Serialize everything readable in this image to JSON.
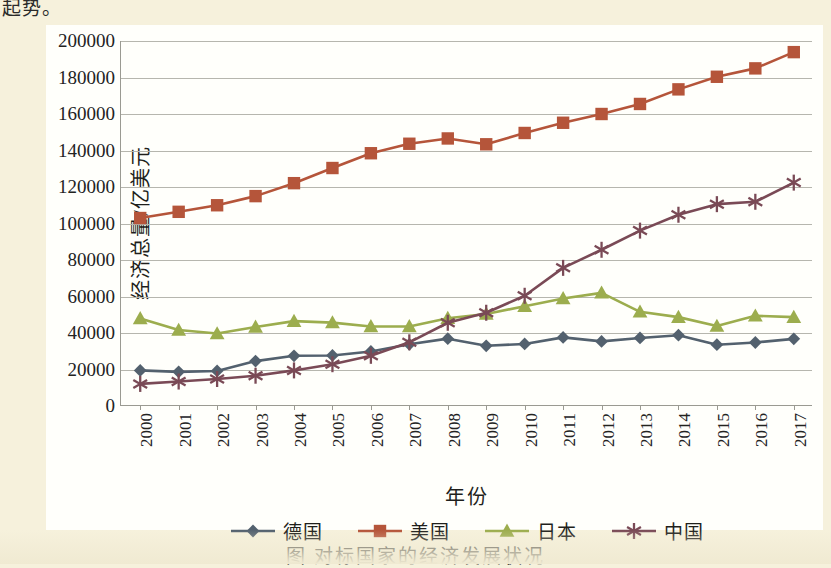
{
  "page": {
    "top_partial_text": "起势。",
    "caption": "图  对标国家的经济发展状况",
    "background_color": "#f6f1dc",
    "panel_color": "#fffffb"
  },
  "chart_data": {
    "type": "line",
    "title": "",
    "xlabel": "年份",
    "ylabel": "经济总量/亿美元",
    "grid": true,
    "legend_position": "bottom",
    "categories": [
      "2000",
      "2001",
      "2002",
      "2003",
      "2004",
      "2005",
      "2006",
      "2007",
      "2008",
      "2009",
      "2010",
      "2011",
      "2012",
      "2013",
      "2014",
      "2015",
      "2016",
      "2017"
    ],
    "x": [
      2000,
      2001,
      2002,
      2003,
      2004,
      2005,
      2006,
      2007,
      2008,
      2009,
      2010,
      2011,
      2012,
      2013,
      2014,
      2015,
      2016,
      2017
    ],
    "ylim": [
      0,
      200000
    ],
    "ytick_step": 20000,
    "yticks": [
      0,
      20000,
      40000,
      60000,
      80000,
      100000,
      120000,
      140000,
      160000,
      180000,
      200000
    ],
    "series": [
      {
        "name": "德国",
        "color": "#53616e",
        "marker": "diamond",
        "values": [
          19500,
          18700,
          19200,
          24600,
          27500,
          27700,
          29900,
          33800,
          36900,
          33000,
          34000,
          37600,
          35400,
          37300,
          38800,
          33600,
          34800,
          36800
        ]
      },
      {
        "name": "美国",
        "color": "#b5553a",
        "marker": "square",
        "values": [
          103000,
          106400,
          110000,
          115000,
          122100,
          130400,
          138500,
          143700,
          146600,
          143400,
          149600,
          155200,
          160000,
          165500,
          173500,
          180400,
          185000,
          193900
        ]
      },
      {
        "name": "日本",
        "color": "#9cad4e",
        "marker": "triangle",
        "values": [
          48000,
          41600,
          39700,
          43300,
          46500,
          45700,
          43600,
          43600,
          48100,
          50400,
          54700,
          58900,
          62000,
          51600,
          48700,
          43800,
          49400,
          48700
        ]
      },
      {
        "name": "中国",
        "color": "#7a4a56",
        "marker": "asterisk",
        "values": [
          12100,
          13400,
          14800,
          16600,
          19500,
          22900,
          27500,
          34900,
          45600,
          51100,
          60400,
          75700,
          85600,
          96100,
          104800,
          110600,
          111900,
          122400
        ]
      }
    ]
  }
}
